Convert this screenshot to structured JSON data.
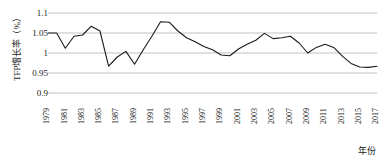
{
  "chart_data": {
    "type": "line",
    "title": "",
    "xlabel": "年份",
    "ylabel": "TFP增长率（%）",
    "ylim": [
      0.9,
      1.1
    ],
    "yticks": [
      "0.9",
      "0.95",
      "1",
      "1.05",
      "1.1"
    ],
    "ytick_values": [
      0.9,
      0.95,
      1.0,
      1.05,
      1.1
    ],
    "grid": true,
    "legend": "none",
    "xlim": [
      1979,
      2017
    ],
    "xtick_labels": [
      "1979",
      "1981",
      "1983",
      "1985",
      "1987",
      "1989",
      "1991",
      "1993",
      "1995",
      "1997",
      "1999",
      "2001",
      "2003",
      "2005",
      "2007",
      "2009",
      "2011",
      "2013",
      "2015",
      "2017"
    ],
    "x": [
      1979,
      1980,
      1981,
      1982,
      1983,
      1984,
      1985,
      1986,
      1987,
      1988,
      1989,
      1990,
      1991,
      1992,
      1993,
      1994,
      1995,
      1996,
      1997,
      1998,
      1999,
      2000,
      2001,
      2002,
      2003,
      2004,
      2005,
      2006,
      2007,
      2008,
      2009,
      2010,
      2011,
      2012,
      2013,
      2014,
      2015,
      2016,
      2017
    ],
    "series": [
      {
        "name": "TFP增长率",
        "color": "#1a1a1a",
        "values": [
          1.05,
          1.05,
          1.012,
          1.042,
          1.045,
          1.067,
          1.055,
          0.967,
          0.99,
          1.004,
          0.972,
          1.008,
          1.042,
          1.078,
          1.077,
          1.055,
          1.038,
          1.028,
          1.016,
          1.008,
          0.995,
          0.993,
          1.01,
          1.022,
          1.032,
          1.049,
          1.036,
          1.038,
          1.042,
          1.025,
          1.0,
          1.014,
          1.022,
          1.014,
          0.992,
          0.974,
          0.965,
          0.964,
          0.967
        ]
      }
    ]
  }
}
